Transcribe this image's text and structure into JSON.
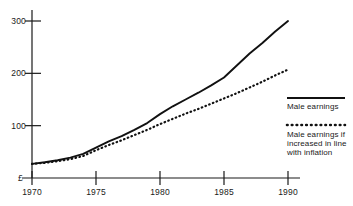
{
  "chart_data": {
    "type": "line",
    "title": "",
    "subtitle": "",
    "xlabel": "",
    "ylabel": "£",
    "currency_symbol": "£",
    "x": [
      1970,
      1971,
      1972,
      1973,
      1974,
      1975,
      1976,
      1977,
      1978,
      1979,
      1980,
      1981,
      1982,
      1983,
      1984,
      1985,
      1986,
      1987,
      1988,
      1989,
      1990
    ],
    "xlim": [
      1969,
      1990
    ],
    "ylim": [
      0,
      330
    ],
    "xticks": [
      1970,
      1975,
      1980,
      1985,
      1990
    ],
    "xtick_labels": [
      "1970",
      "1975",
      "1980",
      "1985",
      "1990"
    ],
    "yticks": [
      100,
      200,
      300
    ],
    "ytick_labels": [
      "100",
      "200",
      "300"
    ],
    "grid": false,
    "legend_position": "right",
    "series": [
      {
        "name": "Male earnings",
        "style": "solid",
        "color": "#111111",
        "values": [
          27,
          30,
          34,
          39,
          46,
          58,
          70,
          80,
          92,
          105,
          122,
          137,
          150,
          163,
          177,
          192,
          215,
          238,
          258,
          280,
          300
        ]
      },
      {
        "name": "Male earnings if increased in line with inflation",
        "style": "dotted",
        "color": "#111111",
        "values": [
          27,
          29,
          32,
          36,
          42,
          53,
          63,
          72,
          82,
          92,
          103,
          113,
          123,
          132,
          142,
          152,
          162,
          173,
          184,
          196,
          207
        ]
      }
    ]
  },
  "axes": {
    "y_axis_name": "value-axis",
    "x_axis_name": "year-axis"
  },
  "legend": {
    "items": [
      {
        "label": "Male earnings",
        "swatch": "solid-line-swatch"
      },
      {
        "label": "Male earnings if increased in line with inflation",
        "swatch": "dotted-line-swatch"
      }
    ]
  }
}
